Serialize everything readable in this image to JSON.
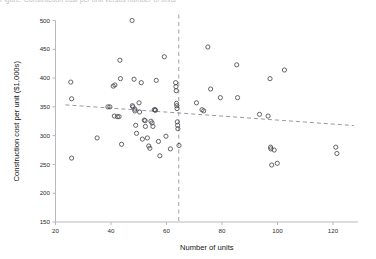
{
  "figure": {
    "top_partial_text": "Figure: Construction cost per unit versus number of units"
  },
  "chart_data": {
    "type": "scatter",
    "title": "",
    "xlabel": "Number of units",
    "ylabel": "Construction cost per unit ($1,000s)",
    "xlim": [
      20,
      129
    ],
    "ylim": [
      150,
      500
    ],
    "xticks": [
      20,
      40,
      60,
      80,
      100,
      120
    ],
    "xticklabels": [
      "20",
      "40",
      "60",
      "80",
      "100",
      "120"
    ],
    "yticks": [
      150,
      200,
      250,
      300,
      350,
      400,
      450,
      500
    ],
    "yticklabels": [
      "150",
      "200",
      "250",
      "300",
      "350",
      "400",
      "450",
      "500"
    ],
    "grid": false,
    "legend": null,
    "marker": "open-circle",
    "marker_color": "#4a4a52",
    "series": [
      {
        "name": "Projects",
        "points": [
          [
            25.5,
            393
          ],
          [
            25.8,
            364
          ],
          [
            25.8,
            261
          ],
          [
            35.0,
            296
          ],
          [
            38.9,
            350
          ],
          [
            39.6,
            350
          ],
          [
            40.8,
            386
          ],
          [
            41.4,
            388
          ],
          [
            41.2,
            334
          ],
          [
            42.3,
            333
          ],
          [
            42.9,
            333
          ],
          [
            43.2,
            431
          ],
          [
            43.4,
            399
          ],
          [
            43.8,
            285
          ],
          [
            47.6,
            500
          ],
          [
            47.7,
            352
          ],
          [
            47.9,
            350
          ],
          [
            48.3,
            398
          ],
          [
            48.6,
            346
          ],
          [
            48.6,
            343
          ],
          [
            48.9,
            318
          ],
          [
            49.2,
            304
          ],
          [
            50.1,
            357
          ],
          [
            50.3,
            341
          ],
          [
            50.9,
            392
          ],
          [
            51.3,
            294
          ],
          [
            52.0,
            327
          ],
          [
            52.3,
            326
          ],
          [
            52.4,
            316
          ],
          [
            53.1,
            296
          ],
          [
            53.6,
            282
          ],
          [
            54.0,
            278
          ],
          [
            54.4,
            325
          ],
          [
            54.8,
            322
          ],
          [
            55.1,
            316
          ],
          [
            55.6,
            345
          ],
          [
            55.9,
            345
          ],
          [
            56.0,
            344
          ],
          [
            56.3,
            396
          ],
          [
            57.1,
            290
          ],
          [
            57.6,
            265
          ],
          [
            59.2,
            437
          ],
          [
            59.8,
            299
          ],
          [
            61.4,
            277
          ],
          [
            63.3,
            392
          ],
          [
            63.4,
            385
          ],
          [
            63.5,
            378
          ],
          [
            63.6,
            356
          ],
          [
            63.7,
            352
          ],
          [
            63.8,
            347
          ],
          [
            63.9,
            324
          ],
          [
            64.0,
            318
          ],
          [
            64.1,
            312
          ],
          [
            64.5,
            283
          ],
          [
            70.8,
            357
          ],
          [
            72.8,
            345
          ],
          [
            73.4,
            343
          ],
          [
            74.9,
            454
          ],
          [
            75.9,
            381
          ],
          [
            79.4,
            366
          ],
          [
            85.3,
            423
          ],
          [
            85.6,
            366
          ],
          [
            93.5,
            337
          ],
          [
            96.6,
            334
          ],
          [
            97.3,
            399
          ],
          [
            97.5,
            280
          ],
          [
            97.6,
            277
          ],
          [
            97.9,
            249
          ],
          [
            98.8,
            275
          ],
          [
            99.9,
            252
          ],
          [
            102.5,
            414
          ],
          [
            121.0,
            280
          ],
          [
            121.4,
            269
          ]
        ]
      }
    ],
    "trend_line": {
      "name": "fitted trend",
      "style": "dashed",
      "color": "#8d8d96",
      "x": [
        23.6,
        127.5
      ],
      "y": [
        353.5,
        317.5
      ]
    },
    "reference_line": {
      "name": "vertical cutoff",
      "orientation": "vertical",
      "style": "dashed",
      "color": "#a9a9b2",
      "x": 64.4
    }
  }
}
